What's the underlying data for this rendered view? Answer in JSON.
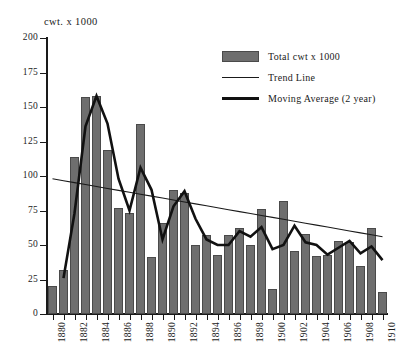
{
  "chart_data": {
    "type": "bar",
    "title": "",
    "xlabel": "",
    "ylabel": "cwt. x 1000",
    "ylim": [
      0,
      200
    ],
    "yticks": [
      0,
      25,
      50,
      75,
      100,
      125,
      150,
      175,
      200
    ],
    "ytick_labels": [
      "0",
      "25",
      "50",
      "75",
      "100",
      "125",
      "150",
      "175",
      "200"
    ],
    "grid": false,
    "legend_position": "top-right",
    "categories": [
      "1880",
      "1881",
      "1882",
      "1883",
      "1884",
      "1885",
      "1886",
      "1887",
      "1888",
      "1889",
      "1890",
      "1891",
      "1892",
      "1893",
      "1894",
      "1895",
      "1896",
      "1897",
      "1898",
      "1899",
      "1900",
      "1901",
      "1902",
      "1903",
      "1904",
      "1905",
      "1906",
      "1907",
      "1908",
      "1909",
      "1910"
    ],
    "xtick_labels": [
      "1880",
      "1882",
      "1884",
      "1886",
      "1888",
      "1890",
      "1892",
      "1894",
      "1896",
      "1898",
      "1900",
      "1902",
      "1904",
      "1906",
      "1908",
      "1910"
    ],
    "series": [
      {
        "name": "Total cwt x 1000",
        "type": "bar",
        "color": "#6e6e6e",
        "values": [
          20,
          32,
          114,
          157,
          158,
          119,
          77,
          73,
          138,
          41,
          66,
          90,
          88,
          50,
          57,
          43,
          57,
          62,
          50,
          76,
          18,
          82,
          46,
          58,
          42,
          43,
          53,
          52,
          35,
          62,
          16
        ]
      },
      {
        "name": "Trend Line",
        "type": "line",
        "color": "#1a1a1a",
        "values": [
          98,
          96.6,
          95.2,
          93.8,
          92.4,
          91,
          89.6,
          88.2,
          86.8,
          85.4,
          84,
          82.6,
          81.2,
          79.8,
          78.4,
          77,
          75.6,
          74.2,
          72.8,
          71.4,
          70,
          68.6,
          67.2,
          65.8,
          64.4,
          63,
          61.6,
          60.2,
          58.8,
          57.4,
          56
        ]
      },
      {
        "name": "Moving Average (2 year)",
        "type": "line",
        "color": "#111111",
        "values": [
          null,
          26,
          73,
          136,
          158,
          138,
          98,
          75,
          106,
          90,
          54,
          78,
          89,
          69,
          54,
          50,
          50,
          60,
          56,
          63,
          47,
          50,
          64,
          52,
          50,
          43,
          48,
          53,
          44,
          49,
          39
        ]
      }
    ],
    "legend": [
      {
        "label": "Total cwt x 1000",
        "key": "swatch"
      },
      {
        "label": "Trend Line",
        "key": "thin-line"
      },
      {
        "label": "Moving Average (2 year)",
        "key": "thick-line"
      }
    ]
  }
}
